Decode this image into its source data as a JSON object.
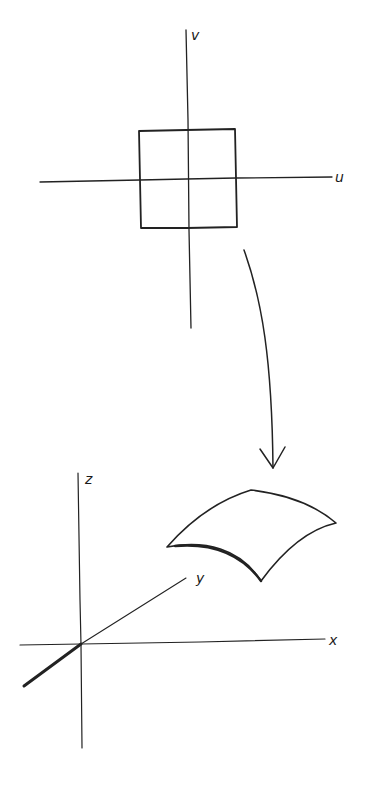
{
  "figure": {
    "uv_plane": {
      "axis_labels": {
        "u": "u",
        "v": "v"
      },
      "shape": "square centered at origin"
    },
    "mapping_arrow": {
      "direction": "down"
    },
    "xyz_space": {
      "axis_labels": {
        "x": "x",
        "y": "y",
        "z": "z"
      },
      "shape": "curved surface patch"
    },
    "colors": {
      "ink": "#222222",
      "background": "#ffffff"
    }
  }
}
